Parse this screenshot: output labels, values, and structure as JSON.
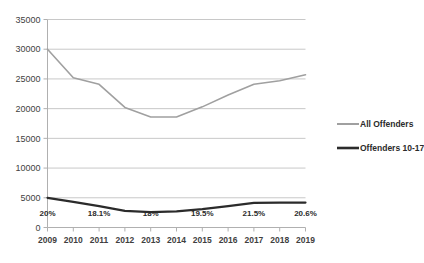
{
  "chart_data": {
    "type": "line",
    "title": "",
    "xlabel": "",
    "ylabel": "",
    "ylim": [
      0,
      35000
    ],
    "ytick_step": 5000,
    "grid": true,
    "legend_position": "right",
    "categories": [
      "2009",
      "2010",
      "2011",
      "2012",
      "2013",
      "2014",
      "2015",
      "2016",
      "2017",
      "2018",
      "2019"
    ],
    "ytick_labels": [
      "0",
      "5000",
      "10000",
      "15000",
      "20000",
      "25000",
      "30000",
      "35000"
    ],
    "ytick_values": [
      0,
      5000,
      10000,
      15000,
      20000,
      25000,
      30000,
      35000
    ],
    "series": [
      {
        "name": "All Offenders",
        "color": "#a0a0a0",
        "width": 1.6,
        "values": [
          30000,
          25200,
          24100,
          20200,
          18600,
          18600,
          20300,
          22300,
          24100,
          24700,
          25700
        ]
      },
      {
        "name": "Offenders 10-17",
        "color": "#2b2b2b",
        "width": 2.2,
        "values": [
          5000,
          4300,
          3600,
          2800,
          2600,
          2700,
          3100,
          3600,
          4150,
          4200,
          4200
        ]
      }
    ],
    "annotations": [
      {
        "text": "20%",
        "category": "2009",
        "value": 2000
      },
      {
        "text": "18.1%",
        "category": "2011",
        "value": 2000
      },
      {
        "text": "18%",
        "category": "2013",
        "value": 2000
      },
      {
        "text": "19.5%",
        "category": "2015",
        "value": 2000
      },
      {
        "text": "21.5%",
        "category": "2017",
        "value": 2000
      },
      {
        "text": "20.6%",
        "category": "2019",
        "value": 2000
      }
    ]
  },
  "legend": {
    "items": [
      {
        "label": "All Offenders"
      },
      {
        "label": "Offenders 10-17"
      }
    ]
  },
  "colors": {
    "all_offenders": "#a0a0a0",
    "offenders_10_17": "#2b2b2b",
    "gridline": "#c8c8c8",
    "axis": "#b0b0b0",
    "text": "#3f3f3f",
    "background": "#ffffff"
  }
}
